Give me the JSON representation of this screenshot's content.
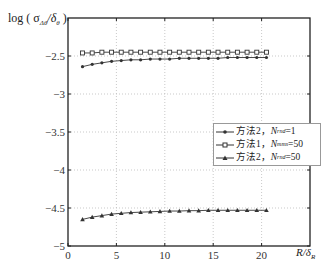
{
  "chart_data": {
    "type": "line",
    "title": "",
    "ylabel": "log ( σ_Δθ/δ_θ )",
    "xlabel": "R/δ_R",
    "xlim": [
      0,
      25
    ],
    "ylim": [
      -5,
      -2
    ],
    "xticks": [
      0,
      5,
      10,
      15,
      20
    ],
    "yticks": [
      -5,
      -4.5,
      -4,
      -3.5,
      -3,
      -2.5
    ],
    "ytick_labels": [
      "-5",
      "-4.5",
      "-4",
      "-3.5",
      "-3",
      "-2.5"
    ],
    "grid": true,
    "legend_position": "center-right",
    "x": [
      1.5,
      2.5,
      3.5,
      4.5,
      5.5,
      6.5,
      7.5,
      8.5,
      9.5,
      10.5,
      11.5,
      12.5,
      13.5,
      14.5,
      15.5,
      16.5,
      17.5,
      18.5,
      19.5,
      20.5
    ],
    "series": [
      {
        "name": "方法2，N_rnd=1",
        "marker": "circle",
        "values": [
          -2.64,
          -2.61,
          -2.59,
          -2.57,
          -2.56,
          -2.55,
          -2.55,
          -2.54,
          -2.54,
          -2.54,
          -2.53,
          -2.53,
          -2.53,
          -2.53,
          -2.53,
          -2.52,
          -2.52,
          -2.52,
          -2.52,
          -2.52
        ]
      },
      {
        "name": "方法1，N_mms=50",
        "marker": "square",
        "values": [
          -2.46,
          -2.46,
          -2.45,
          -2.45,
          -2.45,
          -2.45,
          -2.45,
          -2.45,
          -2.45,
          -2.45,
          -2.45,
          -2.45,
          -2.45,
          -2.45,
          -2.45,
          -2.45,
          -2.45,
          -2.45,
          -2.45,
          -2.45
        ]
      },
      {
        "name": "方法2，N_rnd=50",
        "marker": "triangle",
        "values": [
          -4.65,
          -4.62,
          -4.6,
          -4.58,
          -4.57,
          -4.56,
          -4.555,
          -4.55,
          -4.545,
          -4.54,
          -4.54,
          -4.535,
          -4.535,
          -4.53,
          -4.53,
          -4.53,
          -4.53,
          -4.53,
          -4.53,
          -4.53
        ]
      }
    ]
  },
  "axis": {
    "ylabel_text": "log ( σ",
    "ylabel_sub": "Δθ",
    "ylabel_mid": "/δ",
    "ylabel_sub2": "θ",
    "ylabel_end": " )",
    "xlabel_text": "R/δ",
    "xlabel_sub": "R"
  },
  "legend": [
    {
      "prefix": "方法2，",
      "var": "N",
      "sub": "rnd",
      "suffix": "=1"
    },
    {
      "prefix": "方法1，",
      "var": "N",
      "sub": "mms",
      "suffix": "=50"
    },
    {
      "prefix": "方法2，",
      "var": "N",
      "sub": "rnd",
      "suffix": "=50"
    }
  ]
}
